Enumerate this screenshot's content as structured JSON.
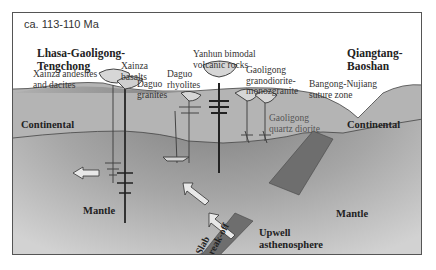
{
  "figure": {
    "age_label": "ca. 113-110 Ma",
    "terranes": {
      "left": [
        "Lhasa-Gaoligong-",
        "Tengchong"
      ],
      "right": [
        "Qiangtang-",
        "Baoshan"
      ]
    },
    "rock_labels": {
      "xainza_andesites": [
        "Xainza andesites",
        "and dacites"
      ],
      "xainza_basalts": [
        "Xainza",
        "basalts"
      ],
      "daguo_granites": [
        "Daguo",
        "granites"
      ],
      "daguo_rhyolites": [
        "Daguo",
        "rhyolites"
      ],
      "yanhun_bimodal": [
        "Yanhun bimodal",
        "volcanic rocks"
      ],
      "gaoligong_granodiorite": [
        "Gaoligong",
        "granodiorite-",
        "monozgranite"
      ],
      "gaoligong_quartz_diorite": [
        "Gaoligong",
        "quartz diorite"
      ],
      "suture": [
        "Bangong-Nujiang",
        "suture zone"
      ]
    },
    "zones": {
      "continental_left": "Continental",
      "continental_right": "Continental",
      "mantle_left": "Mantle",
      "mantle_right": "Mantle"
    },
    "processes": {
      "slab_breakoff": [
        "Slab",
        "break-off"
      ],
      "upwell": [
        "Upwell",
        "asthenosphere"
      ]
    },
    "colors": {
      "crust": "#b4b4b4",
      "mantle_light": "#c8c8c8",
      "mantle_dark": "#8a8a8a",
      "slab": "#6e6e6e",
      "sky": "#ffffff",
      "frame": "#555555"
    }
  }
}
